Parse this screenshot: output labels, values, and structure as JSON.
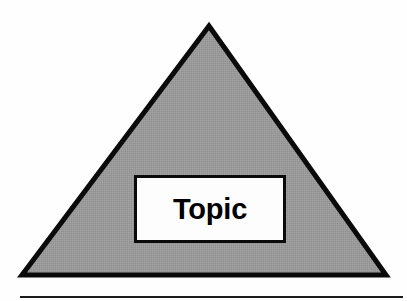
{
  "figure": {
    "name": "topic-triangle-diagram",
    "type": "triangle-diagram",
    "background_color": "#fefefe",
    "shapes": {
      "triangle": {
        "label": "",
        "fill_color": "#999999",
        "stroke_color": "#0a0a0a",
        "stroke_width": 5,
        "apex": {
          "x": 209,
          "y": 26
        },
        "bottom_left": {
          "x": 22,
          "y": 275
        },
        "bottom_right": {
          "x": 386,
          "y": 275
        }
      },
      "topic_box": {
        "label": "Topic",
        "fill_color": "#fdfdfd",
        "stroke_color": "#0a0a0a",
        "stroke_width": 3,
        "x": 134,
        "y": 175,
        "width": 152,
        "height": 68
      },
      "bottom_rule": {
        "color": "#1a1a1a",
        "x": 20,
        "y": 296,
        "width": 383,
        "height": 2
      }
    }
  }
}
